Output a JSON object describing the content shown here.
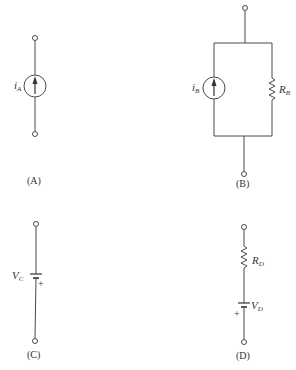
{
  "diagrams": [
    {
      "id": "A",
      "caption": "(A)",
      "components": [
        {
          "type": "current-source",
          "label_main": "i",
          "label_sub": "A",
          "arrow": "up"
        }
      ],
      "terminals": 2
    },
    {
      "id": "B",
      "caption": "(B)",
      "components": [
        {
          "type": "current-source",
          "label_main": "i",
          "label_sub": "B",
          "arrow": "up"
        },
        {
          "type": "resistor",
          "label_main": "R",
          "label_sub": "B"
        }
      ],
      "connection": "parallel",
      "terminals": 2
    },
    {
      "id": "C",
      "caption": "(C)",
      "components": [
        {
          "type": "voltage-source",
          "label_main": "V",
          "label_sub": "C",
          "polarity_mark": "+"
        }
      ],
      "terminals": 2
    },
    {
      "id": "D",
      "caption": "(D)",
      "components": [
        {
          "type": "resistor",
          "label_main": "R",
          "label_sub": "D"
        },
        {
          "type": "voltage-source",
          "label_main": "V",
          "label_sub": "D",
          "polarity_mark": "+"
        }
      ],
      "connection": "series",
      "terminals": 2
    }
  ],
  "colors": {
    "line": "#4a4a4a",
    "text": "#333333",
    "background": "#ffffff"
  }
}
